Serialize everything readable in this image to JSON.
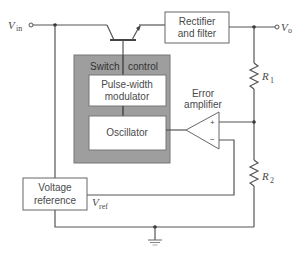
{
  "diagram": {
    "terminals": {
      "vin": {
        "symbol": "V",
        "sub": "in"
      },
      "vo": {
        "symbol": "V",
        "sub": "o"
      }
    },
    "blocks": {
      "rectifier": {
        "line1": "Rectifier",
        "line2": "and filter"
      },
      "switch_control": {
        "left": "Switch",
        "right": "control"
      },
      "pwm": {
        "line1": "Pulse-width",
        "line2": "modulator"
      },
      "oscillator": {
        "label": "Oscillator"
      },
      "voltage_reference": {
        "line1": "Voltage",
        "line2": "reference"
      },
      "error_amplifier": {
        "line1": "Error",
        "line2": "amplifier",
        "plus": "+",
        "minus": "−"
      }
    },
    "resistors": {
      "r1": {
        "symbol": "R",
        "sub": "1"
      },
      "r2": {
        "symbol": "R",
        "sub": "2"
      }
    },
    "vref": {
      "symbol": "V",
      "sub": "ref"
    },
    "colors": {
      "wire": "#555555",
      "switch_control_fill": "#9e9e9e",
      "block_fill": "#ffffff",
      "text": "#4a4a4a"
    }
  }
}
